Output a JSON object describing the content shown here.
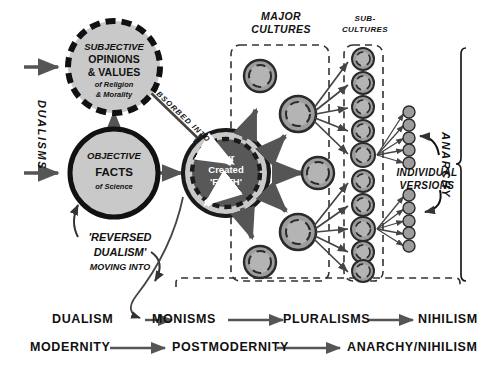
{
  "diagram": {
    "title_absent": true,
    "left_axis_label": "DUALISMS",
    "right_bracket_label": "ANARCHY",
    "headers": {
      "major_cultures": [
        "MAJOR",
        "CULTURES"
      ],
      "sub_cultures": [
        "SUB-",
        "CULTURES"
      ],
      "individual_versions": [
        "INDIVIDUAL",
        "VERSIONS"
      ]
    },
    "nodes": {
      "subjective": {
        "lines": [
          "SUBJECTIVE",
          "OPINIONS",
          "& VALUES"
        ],
        "sub_lines": [
          "of Religion",
          "& Morality"
        ],
        "border": "dashed",
        "fill": "#c9c9c9"
      },
      "objective": {
        "lines": [
          "OBJECTIVE",
          "FACTS"
        ],
        "sub_lines": [
          "of Science"
        ],
        "border": "solid",
        "fill": "#c9c9c9"
      },
      "faith": {
        "lines": [
          "Our",
          "Created",
          "'FAITH'"
        ],
        "fill": "#585858",
        "text_color": "#ffffff"
      }
    },
    "connector_labels": {
      "absorbed_into": "ABSORBED INTO",
      "reversed_dualism": [
        "'REVERSED",
        "DUALISM'",
        "MOVING INTO"
      ]
    },
    "bottom_row_1": {
      "items": [
        "DUALISM",
        "MONISMS",
        "PLURALISMS",
        "NIHILISM"
      ]
    },
    "bottom_row_2": {
      "items": [
        "MODERNITY",
        "POSTMODERNITY",
        "ANARCHY/NIHILISM"
      ]
    },
    "counts": {
      "major_culture_circles": 5,
      "sub_culture_circles": 10,
      "individual_version_dots": 10
    },
    "colors": {
      "circle_fill": "#c9c9c9",
      "circle_fill_dark": "#9d9d9d",
      "faith_fill": "#585858",
      "faith_ring": "#c9c9c9",
      "outline": "#1a1a1a",
      "arrow": "#555555",
      "text": "#111111"
    }
  }
}
